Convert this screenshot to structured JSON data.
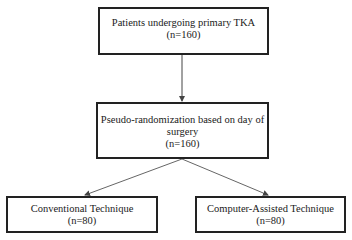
{
  "diagram": {
    "type": "flowchart",
    "nodes": {
      "top": {
        "line1": "Patients undergoing primary TKA",
        "line2": "(n=160)"
      },
      "middle": {
        "line1": "Pseudo-randomization based on day of",
        "line2": "surgery",
        "line3": "(n=160)"
      },
      "left": {
        "line1": "Conventional Technique",
        "line2": "(n=80)"
      },
      "right": {
        "line1": "Computer-Assisted Technique",
        "line2": "(n=80)"
      }
    },
    "edges": [
      {
        "from": "top",
        "to": "middle"
      },
      {
        "from": "middle",
        "to": "left"
      },
      {
        "from": "middle",
        "to": "right"
      }
    ],
    "colors": {
      "stroke": "#222222",
      "arrow": "#555555",
      "background": "#ffffff"
    }
  }
}
